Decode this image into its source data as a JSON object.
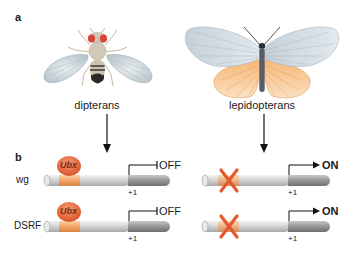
{
  "figure": {
    "panel_a": {
      "label": "a",
      "organisms": [
        {
          "name": "dipterans",
          "illustration": "fruit-fly"
        },
        {
          "name": "lepidopterans",
          "illustration": "butterfly"
        }
      ]
    },
    "panel_b": {
      "label": "b",
      "rows": [
        {
          "gene": "wg",
          "dipteran": {
            "repressor": "Ubx",
            "tss": "+1",
            "state": "OFF"
          },
          "lepidopteran": {
            "repressor_site": "absent",
            "tss": "+1",
            "state": "ON"
          }
        },
        {
          "gene": "DSRF",
          "dipteran": {
            "repressor": "Ubx",
            "tss": "+1",
            "state": "OFF"
          },
          "lepidopteran": {
            "repressor_site": "absent",
            "tss": "+1",
            "state": "ON"
          }
        }
      ]
    },
    "colors": {
      "ubx_fill": "#e8653a",
      "binding_site": "#f2a66a",
      "dna_light": "#d8d8d8",
      "dna_dark": "#9a9a9a",
      "x_mark": "#e55a2b",
      "butterfly_hindwing": "#f5c48e",
      "wing_blue": "#c9d6e0",
      "fly_eye": "#d9433a"
    }
  }
}
